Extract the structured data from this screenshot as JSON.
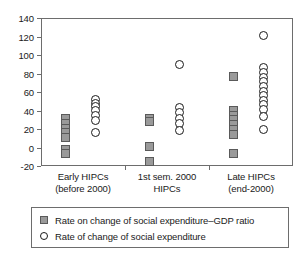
{
  "chart_data": {
    "type": "scatter",
    "title": "",
    "xlabel": "",
    "ylabel": "",
    "ylim": [
      -20,
      140
    ],
    "yticks": [
      -20,
      0,
      20,
      40,
      60,
      80,
      100,
      120,
      140
    ],
    "ytick_labels": [
      "-20",
      "0",
      "20",
      "40",
      "60",
      "80",
      "100",
      "120",
      "140"
    ],
    "grid": false,
    "legend_position": "below-axes",
    "categories": [
      "Early HIPCs\n(before 2000)",
      "1st sem. 2000\nHIPCs",
      "Late HIPCs\n(end-2000)"
    ],
    "category_labels": [
      {
        "line1": "Early HIPCs",
        "line2": "(before 2000)"
      },
      {
        "line1": "1st sem. 2000",
        "line2": "HIPCs"
      },
      {
        "line1": "Late HIPCs",
        "line2": "(end-2000)"
      }
    ],
    "series": [
      {
        "name": "Rate on change of social expenditure–GDP ratio",
        "marker": "square",
        "color": "#9a9a9a",
        "edge_color": "#5a5a5a",
        "groups": [
          {
            "category": "Early HIPCs (before 2000)",
            "values": [
              31,
              26,
              21,
              16,
              11,
              -2,
              -7
            ]
          },
          {
            "category": "1st sem. 2000 HIPCs",
            "values": [
              31,
              28,
              1,
              -15
            ]
          },
          {
            "category": "Late HIPCs (end-2000)",
            "values": [
              77,
              40,
              35,
              30,
              25,
              20,
              14,
              -6
            ]
          }
        ]
      },
      {
        "name": "Rate of change of social expenditure",
        "marker": "circle",
        "color": "#ffffff",
        "edge_color": "#1a1a1a",
        "groups": [
          {
            "category": "Early HIPCs (before 2000)",
            "values": [
              52,
              48,
              44,
              40,
              35,
              29,
              16
            ]
          },
          {
            "category": "1st sem. 2000 HIPCs",
            "values": [
              90,
              43,
              38,
              31,
              26,
              18
            ]
          },
          {
            "category": "Late HIPCs (end-2000)",
            "values": [
              121,
              86,
              81,
              76,
              71,
              66,
              61,
              56,
              51,
              46,
              41,
              33,
              19
            ]
          }
        ]
      }
    ]
  },
  "legend": {
    "items": [
      {
        "marker": "square",
        "label": "Rate on change of social expenditure–GDP ratio"
      },
      {
        "marker": "circle",
        "label": "Rate of change of social expenditure"
      }
    ]
  }
}
